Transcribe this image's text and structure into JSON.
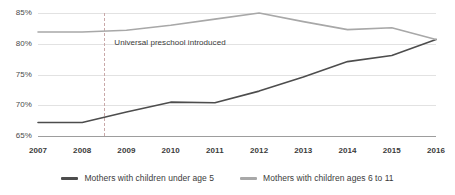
{
  "chart_data": {
    "type": "line",
    "title": "",
    "xlabel": "",
    "ylabel": "",
    "categories": [
      "2007",
      "2008",
      "2009",
      "2010",
      "2011",
      "2012",
      "2013",
      "2014",
      "2015",
      "2016"
    ],
    "x": [
      2007,
      2008,
      2009,
      2010,
      2011,
      2012,
      2013,
      2014,
      2015,
      2016
    ],
    "ylim": [
      65,
      85
    ],
    "ytick_labels": [
      "85%",
      "80%",
      "75%",
      "70%",
      "65%"
    ],
    "ytick_values": [
      85,
      80,
      75,
      70,
      65
    ],
    "grid": true,
    "legend_position": "bottom",
    "series": [
      {
        "name": "Mothers with children under age 5",
        "color": "#4d4d4d",
        "values": [
          67.2,
          67.2,
          68.9,
          70.5,
          70.4,
          72.3,
          74.6,
          77.1,
          78.1,
          80.7
        ]
      },
      {
        "name": "Mothers with children ages 6 to 11",
        "color": "#a8a8a8",
        "values": [
          81.9,
          81.9,
          82.2,
          83.0,
          84.0,
          85.0,
          83.6,
          82.3,
          82.6,
          80.7
        ]
      }
    ],
    "annotations": [
      {
        "label": "Universal preschool introduced",
        "x": 2008.5,
        "style": "dashed-vertical",
        "color": "#c9a9a9"
      }
    ]
  },
  "legend": {
    "items": [
      {
        "label": "Mothers with children under age 5",
        "color": "#4d4d4d"
      },
      {
        "label": "Mothers with children ages 6 to 11",
        "color": "#a8a8a8"
      }
    ]
  },
  "axes": {
    "y": {
      "ticks": [
        {
          "label": "85%",
          "value": 85
        },
        {
          "label": "80%",
          "value": 80
        },
        {
          "label": "75%",
          "value": 75
        },
        {
          "label": "70%",
          "value": 70
        },
        {
          "label": "65%",
          "value": 65
        }
      ]
    },
    "x": {
      "ticks": [
        {
          "label": "2007",
          "value": 2007
        },
        {
          "label": "2008",
          "value": 2008
        },
        {
          "label": "2009",
          "value": 2009
        },
        {
          "label": "2010",
          "value": 2010
        },
        {
          "label": "2011",
          "value": 2011
        },
        {
          "label": "2012",
          "value": 2012
        },
        {
          "label": "2013",
          "value": 2013
        },
        {
          "label": "2014",
          "value": 2014
        },
        {
          "label": "2015",
          "value": 2015
        },
        {
          "label": "2016",
          "value": 2016
        }
      ]
    }
  },
  "annotation": {
    "text": "Universal preschool introduced"
  }
}
